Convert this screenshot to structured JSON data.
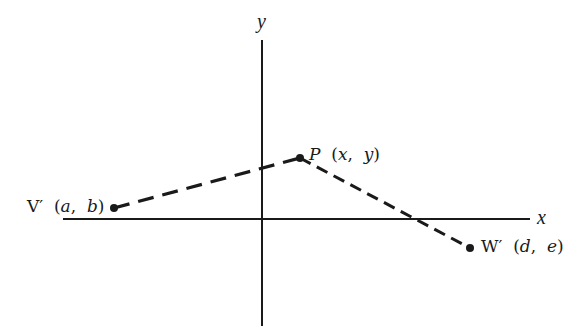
{
  "diagram": {
    "type": "coordinate-plane",
    "axes": {
      "x_label": "x",
      "y_label": "y",
      "origin_px": [
        262,
        219
      ],
      "x_axis_px": [
        63,
        530
      ],
      "y_axis_px": [
        40,
        326
      ],
      "color": "#1a1a1a"
    },
    "points": [
      {
        "id": "V'",
        "name": "V′",
        "coords": "(a, b)",
        "coord_a": "a",
        "coord_b": "b",
        "px": [
          114,
          208
        ]
      },
      {
        "id": "P",
        "name": "P",
        "coords": "(x, y)",
        "coord_a": "x",
        "coord_b": "y",
        "px": [
          300,
          158
        ]
      },
      {
        "id": "W'",
        "name": "W′",
        "coords": "(d, e)",
        "coord_a": "d",
        "coord_b": "e",
        "px": [
          470,
          248
        ]
      }
    ],
    "segments": [
      {
        "from": "V'",
        "to": "P",
        "style": "dashed-heavy"
      },
      {
        "from": "P",
        "to": "W'",
        "style": "dashed"
      }
    ],
    "labels": {
      "v_name": "V′",
      "v_open": "(",
      "v_a": "a",
      "v_sep": ",",
      "v_b": "b",
      "v_close": ")",
      "p_name": "P",
      "p_open": "(",
      "p_a": "x",
      "p_sep": ",",
      "p_b": "y",
      "p_close": ")",
      "w_name": "W′",
      "w_open": "(",
      "w_a": "d",
      "w_sep": ",",
      "w_b": "e",
      "w_close": ")"
    }
  }
}
